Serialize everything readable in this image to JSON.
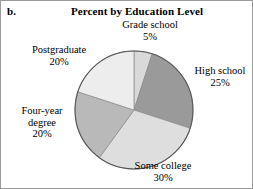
{
  "figure": {
    "panel_letter": "b.",
    "title": "Percent by Education Level"
  },
  "chart_data": {
    "type": "pie",
    "title": "Percent by Education Level",
    "xlabel": "",
    "ylabel": "",
    "legend_position": "none",
    "grid": false,
    "categories": [
      "Grade school",
      "High school",
      "Some college",
      "Four-year degree",
      "Postgraduate"
    ],
    "values": [
      5,
      25,
      30,
      20,
      20
    ],
    "value_suffix": "%",
    "slices": [
      {
        "label": "Grade school",
        "value": 5,
        "value_text": "5%",
        "color": "#d9d9d9",
        "start_angle": 0,
        "end_angle": 18
      },
      {
        "label": "High school",
        "value": 25,
        "value_text": "25%",
        "color": "#9a9a9a",
        "start_angle": 18,
        "end_angle": 108
      },
      {
        "label": "Some college",
        "value": 30,
        "value_text": "30%",
        "color": "#dedede",
        "start_angle": 108,
        "end_angle": 216
      },
      {
        "label": "Four-year degree",
        "value": 20,
        "value_text": "20%",
        "color": "#b9b9b9",
        "start_angle": 216,
        "end_angle": 288
      },
      {
        "label": "Postgraduate",
        "value": 20,
        "value_text": "20%",
        "color": "#ededed",
        "start_angle": 288,
        "end_angle": 360
      }
    ],
    "total": 100,
    "outline_color": "#555555"
  },
  "labels": {
    "grade_school": {
      "name": "Grade school",
      "pct": "5%"
    },
    "high_school": {
      "name": "High school",
      "pct": "25%"
    },
    "some_college": {
      "name": "Some college",
      "pct": "30%"
    },
    "four_year_degree_line1": "Four-year",
    "four_year_degree_line2": "degree",
    "four_year_degree_pct": "20%",
    "postgraduate": {
      "name": "Postgraduate",
      "pct": "20%"
    }
  }
}
